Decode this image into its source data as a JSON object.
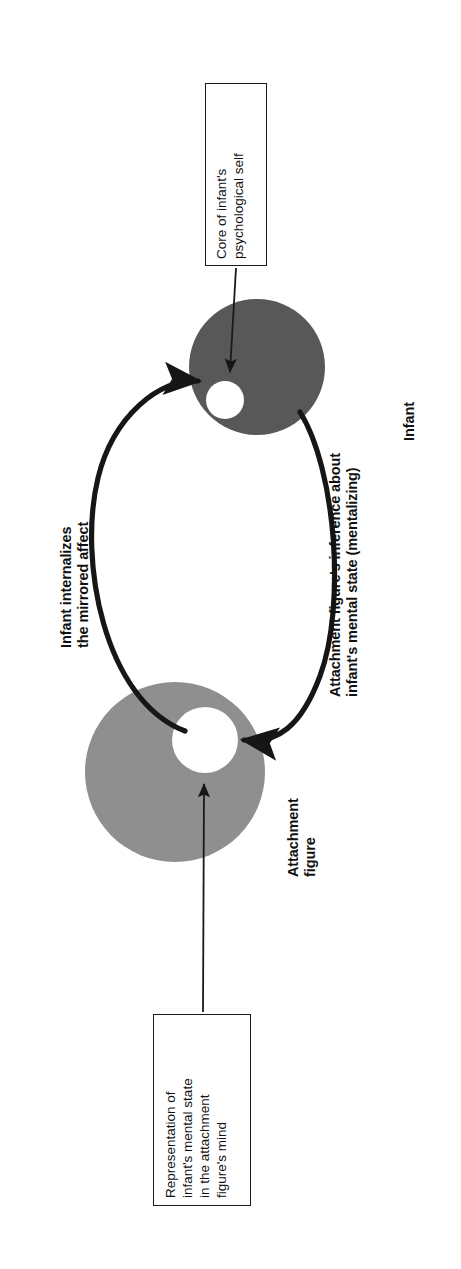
{
  "diagram": {
    "orientation": "rotated-90-ccw",
    "background_color": "#ffffff",
    "colors": {
      "infant_circle": "#585858",
      "attachment_circle": "#8f8f8f",
      "inner_core": "#ffffff",
      "stroke": "#161616",
      "text": "#111111"
    },
    "nodes": [
      {
        "id": "infant",
        "label": "Infant",
        "fill": "#585858",
        "core_fill": "#ffffff",
        "cx": 257,
        "cy": 367,
        "r": 68,
        "core_cx": 225,
        "core_cy": 400,
        "core_r": 19
      },
      {
        "id": "attachment-figure",
        "label": "Attachment\nfigure",
        "fill": "#8f8f8f",
        "core_fill": "#ffffff",
        "cx": 175,
        "cy": 772,
        "r": 90,
        "core_cx": 205,
        "core_cy": 740,
        "core_r": 33
      }
    ],
    "callouts": [
      {
        "id": "core-of-self",
        "text": "Core of infant's\npsychological self",
        "points_to": "infant-core",
        "x": 205,
        "y": 83,
        "w": 62,
        "h": 183
      },
      {
        "id": "representation-of-mental-state",
        "text": "Representation of\ninfant's mental state\nin the attachment\nfigure's mind",
        "points_to": "attachment-figure-core",
        "x": 153,
        "y": 1014,
        "w": 98,
        "h": 192
      }
    ],
    "flow_labels": [
      {
        "id": "internalizes",
        "text": "Infant internalizes\nthe mirrored affect",
        "bold": true,
        "side": "left"
      },
      {
        "id": "mentalizing",
        "text": "Attachment figure's inference about\ninfant's mental state (mentalizing)",
        "bold": true,
        "side": "right"
      }
    ]
  }
}
